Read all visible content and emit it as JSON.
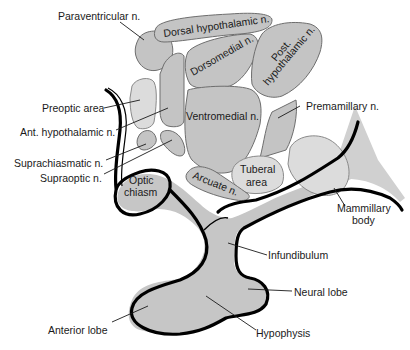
{
  "diagram": {
    "colors": {
      "nucleus_fill": "#c4c4c4",
      "light_nucleus_fill": "#dcdcdc",
      "outline": "#000000",
      "background": "#ffffff"
    },
    "regions": {
      "dorsal_hypothalamic": "Dorsal hypothalamic n.",
      "dorsomedial": "Dorsomedial n.",
      "post_hypothalamic_line1": "Post.",
      "post_hypothalamic_line2": "hypothalamic n.",
      "ventromedial": "Ventromedial n.",
      "tuberal_line1": "Tuberal",
      "tuberal_line2": "area",
      "arcuate": "Arcuate n.",
      "optic_line1": "Optic",
      "optic_line2": "chiasm"
    },
    "labels": {
      "paraventricular": "Paraventricular n.",
      "preoptic": "Preoptic area",
      "ant_hypothalamic": "Ant. hypothalamic n.",
      "suprachiasmatic": "Suprachiasmatic n.",
      "supraoptic": "Supraoptic n.",
      "premamillary": "Premamillary n.",
      "mammillary_line1": "Mammillary",
      "mammillary_line2": "body",
      "infundibulum": "Infundibulum",
      "neural_lobe": "Neural lobe",
      "hypophysis": "Hypophysis",
      "anterior_lobe": "Anterior lobe"
    }
  }
}
